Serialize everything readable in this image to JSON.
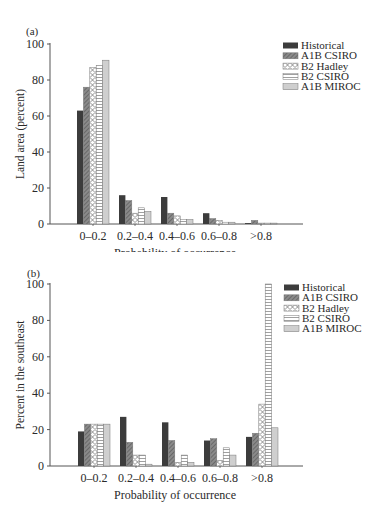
{
  "colors": {
    "axis": "#555555",
    "historical": "#3c3c3c",
    "a1b_csiro": "#7a7a7a",
    "b2_hadley": "#ffffff",
    "b2_csiro": "#ffffff",
    "a1b_miroc": "#cfcfcf"
  },
  "chart_data": [
    {
      "panel_label": "(a)",
      "type": "bar",
      "title": "",
      "xlabel": "Probability of occurrence",
      "ylabel": "Land area (percent)",
      "ylim": [
        0,
        100
      ],
      "yticks": [
        "0",
        "20",
        "40",
        "60",
        "80",
        "100"
      ],
      "grid": false,
      "legend_position": "top-right",
      "categories": [
        "0–0.2",
        "0.2–0.4",
        "0.4–0.6",
        "0.6–0.8",
        ">0.8"
      ],
      "series": [
        {
          "name": "Historical",
          "pattern": "solid-dark",
          "values": [
            63,
            16,
            15,
            6,
            0.5
          ]
        },
        {
          "name": "A1B CSIRO",
          "pattern": "diagonal-gray",
          "values": [
            76,
            13,
            6,
            3,
            2
          ]
        },
        {
          "name": "B2 Hadley",
          "pattern": "crosshatch",
          "values": [
            87,
            6,
            4.5,
            2,
            0.5
          ]
        },
        {
          "name": "B2 CSIRO",
          "pattern": "horizontal-lines",
          "values": [
            88,
            9,
            2.5,
            1,
            0.5
          ]
        },
        {
          "name": "A1B MIROC",
          "pattern": "light-gray",
          "values": [
            91,
            7,
            2.5,
            1,
            0.5
          ]
        }
      ]
    },
    {
      "panel_label": "(b)",
      "type": "bar",
      "title": "",
      "xlabel": "Probability of occurrence",
      "ylabel": "Percent in the southeast",
      "ylim": [
        0,
        100
      ],
      "yticks": [
        "0",
        "20",
        "40",
        "60",
        "80",
        "100"
      ],
      "grid": false,
      "legend_position": "top-right",
      "categories": [
        "0–0.2",
        "0.2–0.4",
        "0.4–0.6",
        "0.6–0.8",
        ">0.8"
      ],
      "series": [
        {
          "name": "Historical",
          "pattern": "solid-dark",
          "values": [
            19,
            27,
            24,
            14,
            16
          ]
        },
        {
          "name": "A1B CSIRO",
          "pattern": "diagonal-gray",
          "values": [
            23,
            13,
            14,
            15,
            18
          ]
        },
        {
          "name": "B2 Hadley",
          "pattern": "crosshatch",
          "values": [
            23,
            6,
            2,
            3,
            34
          ]
        },
        {
          "name": "B2 CSIRO",
          "pattern": "horizontal-lines",
          "values": [
            23,
            6,
            6,
            10,
            100
          ]
        },
        {
          "name": "A1B MIROC",
          "pattern": "light-gray",
          "values": [
            23,
            1,
            2,
            6,
            21
          ]
        }
      ]
    }
  ]
}
